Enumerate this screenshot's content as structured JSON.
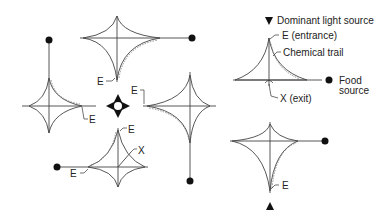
{
  "labels": {
    "entrance_short": "E",
    "exit_short": "X",
    "light_source": "Dominant light source",
    "entrance": "E (entrance)",
    "chemical_trail": "Chemical trail",
    "food_line1": "Food",
    "food_line2": "source",
    "exit": "X (exit)"
  },
  "colors": {
    "line": "#444444",
    "trail": "#777777",
    "marker": "#111111"
  }
}
